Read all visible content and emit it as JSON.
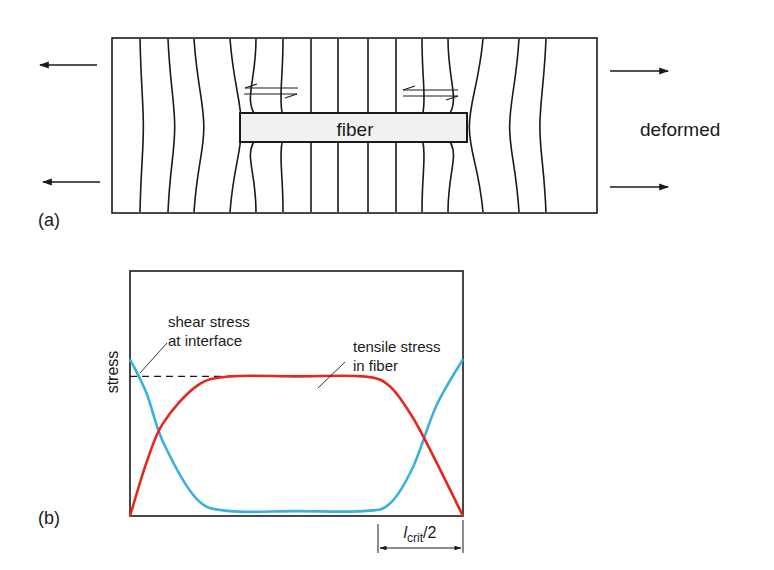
{
  "panel_a": {
    "label": "(a)",
    "fiber_label": "fiber",
    "state_label": "deformed",
    "colors": {
      "line": "#1a1a1a",
      "fiber_fill": "#f2f2f2"
    }
  },
  "panel_b": {
    "label": "(b)",
    "y_axis_label": "stress",
    "shear_annotation": [
      "shear stress",
      "at interface"
    ],
    "tensile_annotation": [
      "tensile stress",
      "in fiber"
    ],
    "dimension_label": {
      "main": "l",
      "subscript": "crit",
      "suffix": "/2"
    },
    "colors": {
      "shear": "#3ab0e2",
      "tensile": "#e8261c",
      "frame": "#1a1a1a"
    }
  },
  "chart_data": {
    "type": "line",
    "title": "",
    "xlabel": "",
    "ylabel": "stress",
    "x_description": "position along fiber length (0 = fiber end, 1 = other end)",
    "xlim": [
      0,
      1
    ],
    "ylim": [
      0,
      1
    ],
    "grid": false,
    "legend": "annotations in plot",
    "series": [
      {
        "name": "shear stress at interface",
        "x": [
          0,
          0.05,
          0.1,
          0.2,
          0.3,
          0.5,
          0.7,
          0.78,
          0.85,
          0.92,
          1.0
        ],
        "y": [
          0.64,
          0.5,
          0.3,
          0.07,
          0.02,
          0.02,
          0.02,
          0.05,
          0.2,
          0.45,
          0.64
        ]
      },
      {
        "name": "tensile stress in fiber",
        "x": [
          0,
          0.05,
          0.1,
          0.2,
          0.3,
          0.5,
          0.7,
          0.78,
          0.85,
          0.92,
          1.0
        ],
        "y": [
          0,
          0.22,
          0.38,
          0.53,
          0.57,
          0.57,
          0.57,
          0.53,
          0.4,
          0.22,
          0
        ]
      }
    ],
    "annotations": [
      {
        "text": "dashed reference line at plateau stress",
        "y": 0.57,
        "x_range": [
          0,
          0.32
        ]
      },
      {
        "text": "l_crit/2",
        "x_range": [
          0.745,
          1.0
        ]
      }
    ]
  }
}
